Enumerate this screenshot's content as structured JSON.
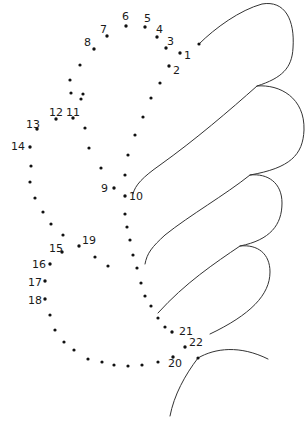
{
  "puzzle": {
    "type": "connect-the-dots",
    "numbered_points": [
      {
        "n": "1",
        "x": 180,
        "y": 53,
        "lx": 184,
        "ly": 59
      },
      {
        "n": "2",
        "x": 169,
        "y": 66,
        "lx": 173,
        "ly": 74
      },
      {
        "n": "3",
        "x": 166,
        "y": 48,
        "lx": 167,
        "ly": 45
      },
      {
        "n": "4",
        "x": 157,
        "y": 37,
        "lx": 156,
        "ly": 33
      },
      {
        "n": "5",
        "x": 145,
        "y": 27,
        "lx": 144,
        "ly": 22
      },
      {
        "n": "6",
        "x": 126,
        "y": 26,
        "lx": 122,
        "ly": 20
      },
      {
        "n": "7",
        "x": 107,
        "y": 36,
        "lx": 100,
        "ly": 33
      },
      {
        "n": "8",
        "x": 94,
        "y": 49,
        "lx": 84,
        "ly": 46
      },
      {
        "n": "9",
        "x": 114,
        "y": 188,
        "lx": 101,
        "ly": 192
      },
      {
        "n": "10",
        "x": 125,
        "y": 196,
        "lx": 129,
        "ly": 200
      },
      {
        "n": "11",
        "x": 73,
        "y": 118,
        "lx": 66,
        "ly": 116
      },
      {
        "n": "12",
        "x": 56,
        "y": 119,
        "lx": 49,
        "ly": 116
      },
      {
        "n": "13",
        "x": 37,
        "y": 129,
        "lx": 26,
        "ly": 128
      },
      {
        "n": "14",
        "x": 30,
        "y": 147,
        "lx": 11,
        "ly": 150
      },
      {
        "n": "15",
        "x": 62,
        "y": 252,
        "lx": 49,
        "ly": 252
      },
      {
        "n": "16",
        "x": 50,
        "y": 264,
        "lx": 32,
        "ly": 268
      },
      {
        "n": "17",
        "x": 45,
        "y": 281,
        "lx": 28,
        "ly": 286
      },
      {
        "n": "18",
        "x": 45,
        "y": 299,
        "lx": 28,
        "ly": 304
      },
      {
        "n": "19",
        "x": 79,
        "y": 246,
        "lx": 82,
        "ly": 244
      },
      {
        "n": "20",
        "x": 173,
        "y": 357,
        "lx": 168,
        "ly": 367
      },
      {
        "n": "21",
        "x": 172,
        "y": 332,
        "lx": 179,
        "ly": 335
      },
      {
        "n": "22",
        "x": 185,
        "y": 347,
        "lx": 189,
        "ly": 346
      }
    ],
    "unnumbered_dots": [
      [
        199,
        44
      ],
      [
        160,
        83
      ],
      [
        151,
        98
      ],
      [
        143,
        117
      ],
      [
        135,
        135
      ],
      [
        128,
        155
      ],
      [
        125,
        175
      ],
      [
        125,
        214
      ],
      [
        127,
        227
      ],
      [
        130,
        240
      ],
      [
        133,
        255
      ],
      [
        137,
        268
      ],
      [
        141,
        283
      ],
      [
        145,
        296
      ],
      [
        151,
        306
      ],
      [
        158,
        318
      ],
      [
        165,
        327
      ],
      [
        83,
        94
      ],
      [
        80,
        65
      ],
      [
        70,
        80
      ],
      [
        71,
        93
      ],
      [
        81,
        99
      ],
      [
        85,
        128
      ],
      [
        89,
        148
      ],
      [
        101,
        168
      ],
      [
        31,
        166
      ],
      [
        30,
        182
      ],
      [
        35,
        198
      ],
      [
        43,
        212
      ],
      [
        51,
        224
      ],
      [
        63,
        235
      ],
      [
        95,
        257
      ],
      [
        108,
        266
      ],
      [
        50,
        315
      ],
      [
        55,
        330
      ],
      [
        64,
        342
      ],
      [
        74,
        350
      ],
      [
        88,
        359
      ],
      [
        102,
        362
      ],
      [
        114,
        365
      ],
      [
        128,
        366
      ],
      [
        142,
        365
      ],
      [
        158,
        362
      ],
      [
        198,
        358
      ]
    ],
    "outline_curves": [
      "M199 44 C 215 28, 240 10, 262 4 C 285 0, 295 20, 293 48 C 292 68, 282 78, 257 86 C 230 110, 195 140, 160 165 C 143 177, 135 185, 133 194",
      "M257 86 C 280 84, 305 98, 304 130 C 303 155, 290 168, 250 175 C 225 195, 190 215, 165 235 C 152 247, 147 253, 145 264",
      "M250 175 C 268 173, 282 183, 282 203 C 282 225, 270 240, 240 246 C 215 263, 185 283, 158 313",
      "M240 246 C 258 244, 270 254, 270 272 C 270 295, 250 315, 210 334",
      "M198 358 C 215 348, 240 345, 268 359",
      "M198 358 C 185 375, 174 395, 170 416"
    ]
  }
}
